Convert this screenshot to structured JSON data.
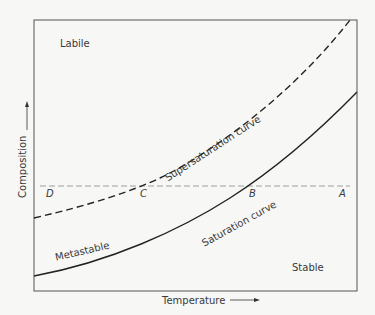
{
  "diagram": {
    "regions": {
      "labile": "Labile",
      "metastable": "Metastable",
      "stable": "Stable"
    },
    "curves": {
      "supersaturation": "Supersaturation curve",
      "saturation": "Saturation curve"
    },
    "points": {
      "A": "A",
      "B": "B",
      "C": "C",
      "D": "D"
    },
    "axes": {
      "x": "Temperature",
      "y": "Composition"
    }
  }
}
